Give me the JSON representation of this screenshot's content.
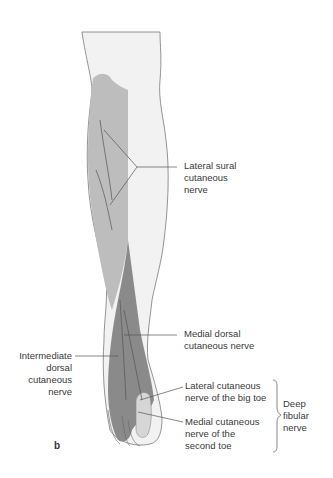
{
  "figure": {
    "panel_letter": "b",
    "colors": {
      "background": "#ffffff",
      "leg_skin": "#f2f2f2",
      "outline": "#7a7a7a",
      "lateral_sural_region": "#bdbdbd",
      "superficial_fibular_region": "#8a8a8a",
      "deep_fibular_region": "#d6d6d6",
      "leader_line": "#555555"
    },
    "labels": {
      "lateral_sural": [
        "Lateral sural",
        "cutaneous",
        "nerve"
      ],
      "medial_dorsal": [
        "Medial dorsal",
        "cutaneous nerve"
      ],
      "intermediate_dorsal": [
        "Intermediate",
        "dorsal",
        "cutaneous",
        "nerve"
      ],
      "lateral_big_toe": [
        "Lateral cutaneous",
        "nerve of the big toe"
      ],
      "medial_second_toe": [
        "Medial cutaneous",
        "nerve of the",
        "second toe"
      ],
      "deep_fibular": [
        "Deep",
        "fibular",
        "nerve"
      ]
    }
  }
}
